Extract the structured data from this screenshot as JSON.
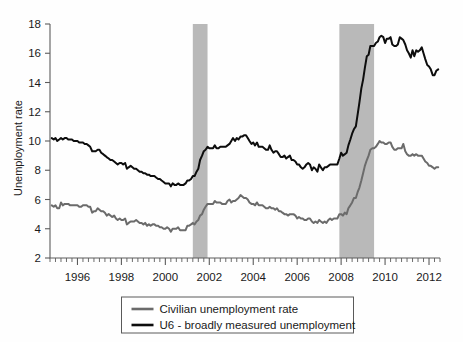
{
  "chart_data": {
    "type": "line",
    "title": "",
    "xlabel": "",
    "ylabel": "Unemployment rate",
    "xlim": [
      1994.75,
      2012.5
    ],
    "ylim": [
      2,
      18
    ],
    "yticks": [
      2,
      4,
      6,
      8,
      10,
      12,
      14,
      16,
      18
    ],
    "xticks": [
      1996,
      1998,
      2000,
      2002,
      2004,
      2006,
      2008,
      2010,
      2012
    ],
    "xtick_labels": [
      "1996",
      "1998",
      "2000",
      "2002",
      "2004",
      "2006",
      "2008",
      "2010",
      "2012"
    ],
    "ytick_labels": [
      "2",
      "4",
      "6",
      "8",
      "10",
      "12",
      "14",
      "16",
      "18"
    ],
    "grid": false,
    "legend_position": "below-center",
    "x_minor_tick_interval": 0.25,
    "shaded_regions": [
      {
        "name": "recession-2001",
        "x0": 2001.25,
        "x1": 2001.92,
        "color": "#b9b9b9"
      },
      {
        "name": "recession-2008",
        "x0": 2007.92,
        "x1": 2009.5,
        "color": "#b9b9b9"
      }
    ],
    "series": [
      {
        "name": "Civilian unemployment rate",
        "color": "#6b6b6b",
        "x": [
          1994.83,
          1994.92,
          1995.0,
          1995.08,
          1995.17,
          1995.25,
          1995.33,
          1995.42,
          1995.5,
          1995.58,
          1995.67,
          1995.75,
          1995.83,
          1995.92,
          1996.0,
          1996.08,
          1996.17,
          1996.25,
          1996.33,
          1996.42,
          1996.5,
          1996.58,
          1996.67,
          1996.75,
          1996.83,
          1996.92,
          1997.0,
          1997.08,
          1997.17,
          1997.25,
          1997.33,
          1997.42,
          1997.5,
          1997.58,
          1997.67,
          1997.75,
          1997.83,
          1997.92,
          1998.0,
          1998.08,
          1998.17,
          1998.25,
          1998.33,
          1998.42,
          1998.5,
          1998.58,
          1998.67,
          1998.75,
          1998.83,
          1998.92,
          1999.0,
          1999.08,
          1999.17,
          1999.25,
          1999.33,
          1999.42,
          1999.5,
          1999.58,
          1999.67,
          1999.75,
          1999.83,
          1999.92,
          2000.0,
          2000.08,
          2000.17,
          2000.25,
          2000.33,
          2000.42,
          2000.5,
          2000.58,
          2000.67,
          2000.75,
          2000.83,
          2000.92,
          2001.0,
          2001.08,
          2001.17,
          2001.25,
          2001.33,
          2001.42,
          2001.5,
          2001.58,
          2001.67,
          2001.75,
          2001.83,
          2001.92,
          2002.0,
          2002.08,
          2002.17,
          2002.25,
          2002.33,
          2002.42,
          2002.5,
          2002.58,
          2002.67,
          2002.75,
          2002.83,
          2002.92,
          2003.0,
          2003.08,
          2003.17,
          2003.25,
          2003.33,
          2003.42,
          2003.5,
          2003.58,
          2003.67,
          2003.75,
          2003.83,
          2003.92,
          2004.0,
          2004.08,
          2004.17,
          2004.25,
          2004.33,
          2004.42,
          2004.5,
          2004.58,
          2004.67,
          2004.75,
          2004.83,
          2004.92,
          2005.0,
          2005.08,
          2005.17,
          2005.25,
          2005.33,
          2005.42,
          2005.5,
          2005.58,
          2005.67,
          2005.75,
          2005.83,
          2005.92,
          2006.0,
          2006.08,
          2006.17,
          2006.25,
          2006.33,
          2006.42,
          2006.5,
          2006.58,
          2006.67,
          2006.75,
          2006.83,
          2006.92,
          2007.0,
          2007.08,
          2007.17,
          2007.25,
          2007.33,
          2007.42,
          2007.5,
          2007.58,
          2007.67,
          2007.75,
          2007.83,
          2007.92,
          2008.0,
          2008.08,
          2008.17,
          2008.25,
          2008.33,
          2008.42,
          2008.5,
          2008.58,
          2008.67,
          2008.75,
          2008.83,
          2008.92,
          2009.0,
          2009.08,
          2009.17,
          2009.25,
          2009.33,
          2009.42,
          2009.5,
          2009.58,
          2009.67,
          2009.75,
          2009.83,
          2009.92,
          2010.0,
          2010.08,
          2010.17,
          2010.25,
          2010.33,
          2010.42,
          2010.5,
          2010.58,
          2010.67,
          2010.75,
          2010.83,
          2010.92,
          2011.0,
          2011.08,
          2011.17,
          2011.25,
          2011.33,
          2011.42,
          2011.5,
          2011.58,
          2011.67,
          2011.75,
          2011.83,
          2011.92,
          2012.0,
          2012.08,
          2012.17,
          2012.25,
          2012.33,
          2012.42
        ],
        "values": [
          5.6,
          5.5,
          5.6,
          5.4,
          5.4,
          5.8,
          5.6,
          5.7,
          5.7,
          5.7,
          5.6,
          5.6,
          5.6,
          5.6,
          5.6,
          5.5,
          5.5,
          5.6,
          5.6,
          5.6,
          5.5,
          5.5,
          5.1,
          5.2,
          5.2,
          5.4,
          5.3,
          5.2,
          5.2,
          5.1,
          4.9,
          5.0,
          4.9,
          4.8,
          4.9,
          4.7,
          4.6,
          4.7,
          4.6,
          4.6,
          4.7,
          4.3,
          4.4,
          4.5,
          4.5,
          4.5,
          4.6,
          4.5,
          4.4,
          4.4,
          4.3,
          4.4,
          4.2,
          4.3,
          4.2,
          4.3,
          4.3,
          4.2,
          4.2,
          4.1,
          4.1,
          4.0,
          4.0,
          4.1,
          4.0,
          3.8,
          4.0,
          4.0,
          4.0,
          4.1,
          3.9,
          3.9,
          3.9,
          3.9,
          4.2,
          4.2,
          4.3,
          4.4,
          4.3,
          4.5,
          4.6,
          4.9,
          5.0,
          5.3,
          5.5,
          5.7,
          5.7,
          5.7,
          5.7,
          5.9,
          5.8,
          5.8,
          5.8,
          5.7,
          5.7,
          5.7,
          5.9,
          6.0,
          5.8,
          5.9,
          5.9,
          6.0,
          6.1,
          6.3,
          6.2,
          6.1,
          6.1,
          6.0,
          5.8,
          5.7,
          5.7,
          5.6,
          5.8,
          5.6,
          5.6,
          5.6,
          5.5,
          5.4,
          5.4,
          5.5,
          5.4,
          5.4,
          5.3,
          5.4,
          5.2,
          5.2,
          5.1,
          5.0,
          5.0,
          4.9,
          5.0,
          5.0,
          5.0,
          4.9,
          4.7,
          4.8,
          4.7,
          4.7,
          4.6,
          4.6,
          4.7,
          4.7,
          4.5,
          4.4,
          4.5,
          4.4,
          4.6,
          4.5,
          4.4,
          4.5,
          4.4,
          4.6,
          4.7,
          4.6,
          4.7,
          4.7,
          4.7,
          5.0,
          5.0,
          4.9,
          5.1,
          5.0,
          5.4,
          5.6,
          5.8,
          6.1,
          6.1,
          6.5,
          6.8,
          7.3,
          7.8,
          8.3,
          8.7,
          9.0,
          9.4,
          9.5,
          9.5,
          9.6,
          9.8,
          10.0,
          9.9,
          9.9,
          9.8,
          9.8,
          9.9,
          9.9,
          9.6,
          9.4,
          9.4,
          9.5,
          9.5,
          9.5,
          9.8,
          9.3,
          9.1,
          9.0,
          9.0,
          9.1,
          9.0,
          9.1,
          9.0,
          9.0,
          9.0,
          8.8,
          8.6,
          8.5,
          8.3,
          8.3,
          8.2,
          8.1,
          8.2,
          8.2
        ]
      },
      {
        "name": "U6 - broadly measured unemployment",
        "color": "#0d0d0d",
        "x": [
          1994.83,
          1994.92,
          1995.0,
          1995.08,
          1995.17,
          1995.25,
          1995.33,
          1995.42,
          1995.5,
          1995.58,
          1995.67,
          1995.75,
          1995.83,
          1995.92,
          1996.0,
          1996.08,
          1996.17,
          1996.25,
          1996.33,
          1996.42,
          1996.5,
          1996.58,
          1996.67,
          1996.75,
          1996.83,
          1996.92,
          1997.0,
          1997.08,
          1997.17,
          1997.25,
          1997.33,
          1997.42,
          1997.5,
          1997.58,
          1997.67,
          1997.75,
          1997.83,
          1997.92,
          1998.0,
          1998.08,
          1998.17,
          1998.25,
          1998.33,
          1998.42,
          1998.5,
          1998.58,
          1998.67,
          1998.75,
          1998.83,
          1998.92,
          1999.0,
          1999.08,
          1999.17,
          1999.25,
          1999.33,
          1999.42,
          1999.5,
          1999.58,
          1999.67,
          1999.75,
          1999.83,
          1999.92,
          2000.0,
          2000.08,
          2000.17,
          2000.25,
          2000.33,
          2000.42,
          2000.5,
          2000.58,
          2000.67,
          2000.75,
          2000.83,
          2000.92,
          2001.0,
          2001.08,
          2001.17,
          2001.25,
          2001.33,
          2001.42,
          2001.5,
          2001.58,
          2001.67,
          2001.75,
          2001.83,
          2001.92,
          2002.0,
          2002.08,
          2002.17,
          2002.25,
          2002.33,
          2002.42,
          2002.5,
          2002.58,
          2002.67,
          2002.75,
          2002.83,
          2002.92,
          2003.0,
          2003.08,
          2003.17,
          2003.25,
          2003.33,
          2003.42,
          2003.5,
          2003.58,
          2003.67,
          2003.75,
          2003.83,
          2003.92,
          2004.0,
          2004.08,
          2004.17,
          2004.25,
          2004.33,
          2004.42,
          2004.5,
          2004.58,
          2004.67,
          2004.75,
          2004.83,
          2004.92,
          2005.0,
          2005.08,
          2005.17,
          2005.25,
          2005.33,
          2005.42,
          2005.5,
          2005.58,
          2005.67,
          2005.75,
          2005.83,
          2005.92,
          2006.0,
          2006.08,
          2006.17,
          2006.25,
          2006.33,
          2006.42,
          2006.5,
          2006.58,
          2006.67,
          2006.75,
          2006.83,
          2006.92,
          2007.0,
          2007.08,
          2007.17,
          2007.25,
          2007.33,
          2007.42,
          2007.5,
          2007.58,
          2007.67,
          2007.75,
          2007.83,
          2007.92,
          2008.0,
          2008.08,
          2008.17,
          2008.25,
          2008.33,
          2008.42,
          2008.5,
          2008.58,
          2008.67,
          2008.75,
          2008.83,
          2008.92,
          2009.0,
          2009.08,
          2009.17,
          2009.25,
          2009.33,
          2009.42,
          2009.5,
          2009.58,
          2009.67,
          2009.75,
          2009.83,
          2009.92,
          2010.0,
          2010.08,
          2010.17,
          2010.25,
          2010.33,
          2010.42,
          2010.5,
          2010.58,
          2010.67,
          2010.75,
          2010.83,
          2010.92,
          2011.0,
          2011.08,
          2011.17,
          2011.25,
          2011.33,
          2011.42,
          2011.5,
          2011.58,
          2011.67,
          2011.75,
          2011.83,
          2011.92,
          2012.0,
          2012.08,
          2012.17,
          2012.25,
          2012.33,
          2012.42
        ],
        "values": [
          10.2,
          10.1,
          10.2,
          10.0,
          10.1,
          10.2,
          10.1,
          10.2,
          10.2,
          10.1,
          10.1,
          10.1,
          10.0,
          10.0,
          10.0,
          9.9,
          9.9,
          9.9,
          9.8,
          9.8,
          9.7,
          9.6,
          9.3,
          9.3,
          9.3,
          9.4,
          9.4,
          9.2,
          9.1,
          9.0,
          8.9,
          8.8,
          8.7,
          8.7,
          8.6,
          8.5,
          8.4,
          8.5,
          8.5,
          8.4,
          8.5,
          8.1,
          8.2,
          8.3,
          8.2,
          8.1,
          8.1,
          8.0,
          7.9,
          7.9,
          7.8,
          7.8,
          7.7,
          7.7,
          7.6,
          7.6,
          7.6,
          7.5,
          7.4,
          7.4,
          7.3,
          7.2,
          7.1,
          7.1,
          7.1,
          6.9,
          7.1,
          7.0,
          7.0,
          7.1,
          7.0,
          7.0,
          7.0,
          7.1,
          7.3,
          7.3,
          7.4,
          7.6,
          7.6,
          7.9,
          8.1,
          8.7,
          9.0,
          9.3,
          9.4,
          9.6,
          9.5,
          9.5,
          9.5,
          9.7,
          9.5,
          9.5,
          9.6,
          9.6,
          9.6,
          9.6,
          9.7,
          9.8,
          10.0,
          10.2,
          10.0,
          10.2,
          10.1,
          10.3,
          10.3,
          10.4,
          10.4,
          10.2,
          10.0,
          9.8,
          9.9,
          9.7,
          9.9,
          9.6,
          9.6,
          9.6,
          9.5,
          9.4,
          9.4,
          9.7,
          9.4,
          9.2,
          9.3,
          9.3,
          9.1,
          8.9,
          8.9,
          9.0,
          8.8,
          8.9,
          9.0,
          8.7,
          8.7,
          8.6,
          8.4,
          8.4,
          8.2,
          8.1,
          8.2,
          8.4,
          8.5,
          8.4,
          8.0,
          8.2,
          8.1,
          7.9,
          8.4,
          8.2,
          8.0,
          8.2,
          8.2,
          8.3,
          8.4,
          8.4,
          8.4,
          8.4,
          8.4,
          8.8,
          9.2,
          9.0,
          9.1,
          9.2,
          9.7,
          10.1,
          10.5,
          10.8,
          11.0,
          11.8,
          12.6,
          13.6,
          14.2,
          15.0,
          15.8,
          15.9,
          16.5,
          16.5,
          16.5,
          16.7,
          16.8,
          17.1,
          17.2,
          17.1,
          16.7,
          17.0,
          17.0,
          17.1,
          16.6,
          16.5,
          16.5,
          16.6,
          17.1,
          17.0,
          16.9,
          16.6,
          16.2,
          16.0,
          15.7,
          16.2,
          15.8,
          16.2,
          16.1,
          16.2,
          16.4,
          16.0,
          15.6,
          15.2,
          15.1,
          14.9,
          14.5,
          14.5,
          14.8,
          14.9
        ]
      }
    ]
  },
  "legend": {
    "entries": [
      {
        "label": "Civilian unemployment rate",
        "color": "#6b6b6b"
      },
      {
        "label": "U6 - broadly measured unemployment",
        "color": "#0d0d0d"
      }
    ]
  }
}
